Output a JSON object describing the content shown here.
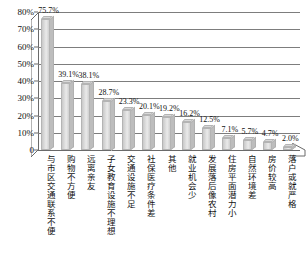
{
  "chart_data": {
    "type": "bar",
    "title": "",
    "xlabel": "",
    "ylabel": "",
    "ylim": [
      0,
      80
    ],
    "ytick_labels": [
      "0",
      "10%",
      "20%",
      "30%",
      "40%",
      "50%",
      "60%",
      "70%",
      "80%"
    ],
    "ytick_values": [
      0,
      10,
      20,
      30,
      40,
      50,
      60,
      70,
      80
    ],
    "grid": true,
    "legend": false,
    "bar_color": "#dcdcdc",
    "categories": [
      "与市区交通联系不便",
      "购物不方便",
      "远离亲友",
      "子女教育设施不理想",
      "交通设施不足",
      "社保医疗条件差",
      "其他",
      "就业机会少",
      "发展落后像农村",
      "住房平面潜力小",
      "自然环境差",
      "房价较高",
      "落户或就严格"
    ],
    "values": [
      75.7,
      39.1,
      38.1,
      28.7,
      23.3,
      20.1,
      19.2,
      16.2,
      12.5,
      7.1,
      5.7,
      4.7,
      2.0
    ],
    "value_labels": [
      "75.7%",
      "39.1%",
      "38.1%",
      "28.7%",
      "23.3%",
      "20.1%",
      "19.2%",
      "16.2%",
      "12.5%",
      "7.1%",
      "5.7%",
      "4.7%",
      "2.0%"
    ]
  }
}
